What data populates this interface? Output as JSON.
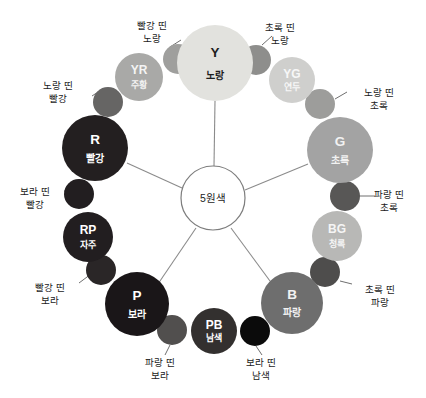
{
  "diagram": {
    "title_hub": "5원색",
    "background": "#ffffff",
    "hub": {
      "cx": 213,
      "cy": 198,
      "r": 32,
      "label": "5원색",
      "fill": "#ffffff",
      "stroke": "#7d7d7d"
    },
    "primary_nodes": [
      {
        "id": "Y",
        "code": "Y",
        "name": "노랑",
        "cx": 215,
        "cy": 63,
        "r": 38,
        "fill": "#e2e2de",
        "text_color": "#1d1d1d",
        "spoke": true
      },
      {
        "id": "R",
        "code": "R",
        "name": "빨강",
        "cx": 95,
        "cy": 148,
        "r": 33,
        "fill": "#231f20",
        "text_color": "#ffffff",
        "spoke": true
      },
      {
        "id": "G",
        "code": "G",
        "name": "초록",
        "cx": 340,
        "cy": 150,
        "r": 33,
        "fill": "#a3a3a3",
        "text_color": "#f2f2f2",
        "spoke": true
      },
      {
        "id": "P",
        "code": "P",
        "name": "보라",
        "cx": 137,
        "cy": 304,
        "r": 32,
        "fill": "#1a1618",
        "text_color": "#ffffff",
        "spoke": true
      },
      {
        "id": "B",
        "code": "B",
        "name": "파랑",
        "cx": 292,
        "cy": 303,
        "r": 31,
        "fill": "#6e6e6e",
        "text_color": "#f2f2f2",
        "spoke": true
      }
    ],
    "secondary_nodes": [
      {
        "id": "YR",
        "code": "YR",
        "name": "주황",
        "cx": 139,
        "cy": 77,
        "r": 24,
        "fill": "#a9a9a7",
        "text_color": "#f4f4f4"
      },
      {
        "id": "YG",
        "code": "YG",
        "name": "연두",
        "cx": 292,
        "cy": 80,
        "r": 23,
        "fill": "#cfcfcd",
        "text_color": "#f7f7f7"
      },
      {
        "id": "BG",
        "code": "BG",
        "name": "청록",
        "cx": 337,
        "cy": 236,
        "r": 25,
        "fill": "#b8b8b6",
        "text_color": "#f5f5f5"
      },
      {
        "id": "RP",
        "code": "RP",
        "name": "자주",
        "cx": 88,
        "cy": 237,
        "r": 25,
        "fill": "#221e20",
        "text_color": "#ffffff"
      },
      {
        "id": "PB",
        "code": "PB",
        "name": "남색",
        "cx": 214,
        "cy": 331,
        "r": 23,
        "fill": "#33302f",
        "text_color": "#ffffff"
      }
    ],
    "tertiary_nodes": [
      {
        "id": "red-yellow",
        "cx": 178,
        "cy": 59,
        "r": 15,
        "fill": "#9f9f9d"
      },
      {
        "id": "green-yellow",
        "cx": 256,
        "cy": 60,
        "r": 15,
        "fill": "#8e8e8c"
      },
      {
        "id": "yellow-red",
        "cx": 108,
        "cy": 102,
        "r": 15,
        "fill": "#666564"
      },
      {
        "id": "yellow-green",
        "cx": 320,
        "cy": 104,
        "r": 15,
        "fill": "#9d9d9b"
      },
      {
        "id": "purple-red",
        "cx": 79,
        "cy": 194,
        "r": 15,
        "fill": "#221e20"
      },
      {
        "id": "blue-green",
        "cx": 345,
        "cy": 196,
        "r": 15,
        "fill": "#585756"
      },
      {
        "id": "red-purple",
        "cx": 101,
        "cy": 270,
        "r": 15,
        "fill": "#2a2627"
      },
      {
        "id": "green-blue",
        "cx": 325,
        "cy": 272,
        "r": 15,
        "fill": "#4e4d4c"
      },
      {
        "id": "blue-purple",
        "cx": 172,
        "cy": 330,
        "r": 15,
        "fill": "#514f4e"
      },
      {
        "id": "purple-navy",
        "cx": 255,
        "cy": 331,
        "r": 15,
        "fill": "#0b0b0b"
      }
    ],
    "annotations": [
      {
        "id": "red-yellow",
        "lines": [
          "빨강 띤",
          "노랑"
        ],
        "tx": 152,
        "ty": 26,
        "anchor": "middle",
        "line": {
          "x1": 170,
          "y1": 47,
          "x2": 181,
          "y2": 40
        }
      },
      {
        "id": "green-yellow",
        "lines": [
          "초록 띤",
          "노랑"
        ],
        "tx": 280,
        "ty": 28,
        "anchor": "middle",
        "line": {
          "x1": 262,
          "y1": 45,
          "x2": 272,
          "y2": 36
        }
      },
      {
        "id": "yellow-red",
        "lines": [
          "노랑 띤",
          "빨강"
        ],
        "tx": 58,
        "ty": 86,
        "anchor": "middle",
        "line": {
          "x1": 92,
          "y1": 96,
          "x2": 101,
          "y2": 90
        }
      },
      {
        "id": "yellow-green",
        "lines": [
          "노랑 띤",
          "초록"
        ],
        "tx": 379,
        "ty": 93,
        "anchor": "middle",
        "line": {
          "x1": 335,
          "y1": 99,
          "x2": 347,
          "y2": 92
        }
      },
      {
        "id": "purple-red",
        "lines": [
          "보라 띤",
          "빨강"
        ],
        "tx": 35,
        "ty": 192,
        "anchor": "middle",
        "line": {
          "x1": 64,
          "y1": 191,
          "x2": 80,
          "y2": 191
        }
      },
      {
        "id": "blue-green",
        "lines": [
          "파랑 띤",
          "초록"
        ],
        "tx": 389,
        "ty": 195,
        "anchor": "middle",
        "line": {
          "x1": 359,
          "y1": 196,
          "x2": 375,
          "y2": 196
        }
      },
      {
        "id": "red-purple",
        "lines": [
          "빨강 띤",
          "보라"
        ],
        "tx": 50,
        "ty": 288,
        "anchor": "middle",
        "line": {
          "x1": 79,
          "y1": 283,
          "x2": 91,
          "y2": 274
        }
      },
      {
        "id": "green-blue",
        "lines": [
          "초록 띤",
          "파랑"
        ],
        "tx": 380,
        "ty": 290,
        "anchor": "middle",
        "line": {
          "x1": 340,
          "y1": 281,
          "x2": 352,
          "y2": 284
        }
      },
      {
        "id": "blue-purple",
        "lines": [
          "파랑 띤",
          "보라"
        ],
        "tx": 160,
        "ty": 363,
        "anchor": "middle",
        "line": {
          "x1": 170,
          "y1": 345,
          "x2": 165,
          "y2": 355
        }
      },
      {
        "id": "purple-navy",
        "lines": [
          "보라 띤",
          "남색"
        ],
        "tx": 261,
        "ty": 363,
        "anchor": "middle",
        "line": {
          "x1": 256,
          "y1": 346,
          "x2": 262,
          "y2": 355
        }
      }
    ],
    "spokes": [
      {
        "id": "spoke-Y",
        "x1": 214,
        "y1": 166,
        "x2": 215,
        "y2": 101
      },
      {
        "id": "spoke-R",
        "x1": 182,
        "y1": 188,
        "x2": 127,
        "y2": 163
      },
      {
        "id": "spoke-G",
        "x1": 245,
        "y1": 190,
        "x2": 308,
        "y2": 164
      },
      {
        "id": "spoke-P",
        "x1": 196,
        "y1": 228,
        "x2": 160,
        "y2": 281
      },
      {
        "id": "spoke-B",
        "x1": 231,
        "y1": 228,
        "x2": 270,
        "y2": 281
      }
    ]
  }
}
